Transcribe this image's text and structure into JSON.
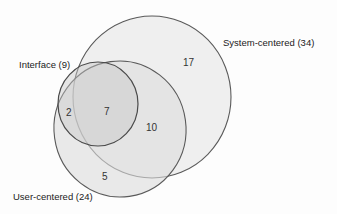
{
  "diagram": {
    "type": "venn",
    "sets": [
      {
        "name": "System-centered",
        "label": "System-centered (34)",
        "total": 34
      },
      {
        "name": "User-centered",
        "label": "User-centered (24)",
        "total": 24
      },
      {
        "name": "Interface",
        "label": "Interface (9)",
        "total": 9
      }
    ],
    "regions": [
      {
        "id": "system_only",
        "value": "17"
      },
      {
        "id": "system_user_only",
        "value": "10"
      },
      {
        "id": "all_three",
        "value": "7"
      },
      {
        "id": "user_interface_only",
        "value": "2"
      },
      {
        "id": "user_only",
        "value": "5"
      }
    ],
    "colors": {
      "outline": "#5a5a5a",
      "system_fill": "#efefef",
      "user_fill": "#e2e2e2",
      "interface_fill": "#d3d3d3"
    }
  }
}
